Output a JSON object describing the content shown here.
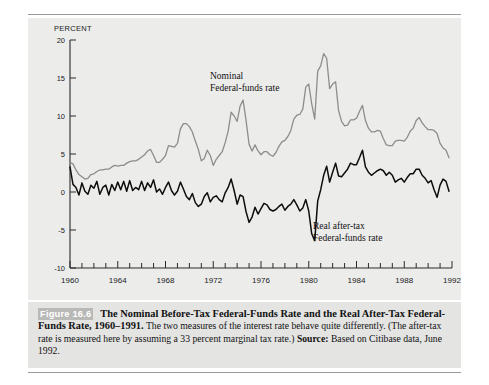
{
  "figure": {
    "number_label": "Figure 16.6",
    "title": "The  Nominal Before-Tax Federal-Funds Rate and the Real After-Tax Federal-Funds Rate, 1960–1991.",
    "body_text_1": " The two measures of the interest rate behave quite differently. (The after-tax rate is measured here by assuming a 33 percent marginal tax rate.) ",
    "source_label": "Source:",
    "source_text": " Based on Citibase data, June 1992."
  },
  "colors": {
    "panel_background": "#ececeb",
    "caption_background": "#e4e4e3",
    "nominal_series": "#8d8d8d",
    "real_series": "#0d0d0d",
    "axis": "#2a2a2a",
    "badge_background": "#b9b9b8"
  },
  "annotations": {
    "nominal": [
      "Nominal",
      "Federal-funds rate"
    ],
    "real": [
      "Real after-tax",
      "Federal-funds rate"
    ]
  },
  "chart_data": {
    "type": "line",
    "xlabel": "",
    "ylabel": "PERCENT",
    "ylim": [
      -10,
      20
    ],
    "xlim": [
      1960,
      1992
    ],
    "ytick_values": [
      -10,
      -5,
      0,
      5,
      10,
      15,
      20
    ],
    "ytick_labels": [
      "-10",
      "-5",
      "0",
      "5",
      "10",
      "15",
      "20"
    ],
    "xtick_labels": [
      "1960",
      "1964",
      "1968",
      "1972",
      "1976",
      "1980",
      "1984",
      "1988",
      "1992"
    ],
    "xtick_values": [
      1960,
      1964,
      1968,
      1972,
      1976,
      1980,
      1984,
      1988,
      1992
    ],
    "xminor_step": 1,
    "grid": false,
    "legend": "annotated-inline",
    "series": [
      {
        "name": "Nominal Federal-funds rate",
        "color": "#8d8d8d",
        "x": [
          1960.0,
          1960.25,
          1960.5,
          1960.75,
          1961.0,
          1961.25,
          1961.5,
          1961.75,
          1962.0,
          1962.25,
          1962.5,
          1962.75,
          1963.0,
          1963.25,
          1963.5,
          1963.75,
          1964.0,
          1964.25,
          1964.5,
          1964.75,
          1965.0,
          1965.25,
          1965.5,
          1965.75,
          1966.0,
          1966.25,
          1966.5,
          1966.75,
          1967.0,
          1967.25,
          1967.5,
          1967.75,
          1968.0,
          1968.25,
          1968.5,
          1968.75,
          1969.0,
          1969.25,
          1969.5,
          1969.75,
          1970.0,
          1970.25,
          1970.5,
          1970.75,
          1971.0,
          1971.25,
          1971.5,
          1971.75,
          1972.0,
          1972.25,
          1972.5,
          1972.75,
          1973.0,
          1973.25,
          1973.5,
          1973.75,
          1974.0,
          1974.25,
          1974.5,
          1974.75,
          1975.0,
          1975.25,
          1975.5,
          1975.75,
          1976.0,
          1976.25,
          1976.5,
          1976.75,
          1977.0,
          1977.25,
          1977.5,
          1977.75,
          1978.0,
          1978.25,
          1978.5,
          1978.75,
          1979.0,
          1979.25,
          1979.5,
          1979.75,
          1980.0,
          1980.25,
          1980.5,
          1980.75,
          1981.0,
          1981.25,
          1981.5,
          1981.75,
          1982.0,
          1982.25,
          1982.5,
          1982.75,
          1983.0,
          1983.25,
          1983.5,
          1983.75,
          1984.0,
          1984.25,
          1984.5,
          1984.75,
          1985.0,
          1985.25,
          1985.5,
          1985.75,
          1986.0,
          1986.25,
          1986.5,
          1986.75,
          1987.0,
          1987.25,
          1987.5,
          1987.75,
          1988.0,
          1988.25,
          1988.5,
          1988.75,
          1989.0,
          1989.25,
          1989.5,
          1989.75,
          1990.0,
          1990.25,
          1990.5,
          1990.75,
          1991.0,
          1991.25,
          1991.5,
          1991.75
        ],
        "y": [
          3.9,
          3.7,
          2.9,
          2.3,
          2.0,
          1.7,
          1.8,
          2.3,
          2.4,
          2.7,
          2.9,
          2.9,
          3.0,
          3.0,
          3.3,
          3.5,
          3.4,
          3.5,
          3.5,
          3.8,
          4.0,
          4.1,
          4.1,
          4.3,
          4.6,
          4.9,
          5.4,
          5.6,
          4.8,
          3.9,
          3.9,
          4.3,
          4.8,
          6.1,
          6.0,
          5.9,
          6.4,
          8.3,
          9.0,
          9.0,
          8.6,
          7.9,
          6.7,
          5.6,
          4.1,
          4.4,
          5.5,
          4.8,
          3.5,
          4.3,
          4.8,
          5.3,
          6.5,
          8.0,
          10.5,
          10.0,
          9.3,
          11.3,
          12.1,
          9.4,
          6.3,
          5.4,
          6.2,
          5.4,
          4.9,
          5.3,
          5.3,
          4.9,
          4.7,
          5.2,
          6.0,
          6.6,
          6.8,
          7.3,
          8.1,
          9.6,
          10.1,
          10.2,
          10.9,
          13.8,
          14.2,
          11.6,
          9.6,
          15.9,
          16.6,
          18.2,
          17.6,
          13.6,
          14.2,
          14.5,
          10.7,
          9.3,
          8.7,
          8.8,
          9.5,
          9.5,
          9.7,
          10.6,
          11.4,
          9.4,
          8.4,
          7.9,
          7.9,
          8.1,
          8.0,
          7.0,
          6.2,
          6.1,
          6.1,
          6.7,
          6.8,
          6.8,
          6.7,
          7.2,
          8.0,
          8.4,
          9.4,
          9.8,
          9.1,
          8.6,
          8.2,
          8.2,
          8.1,
          7.7,
          6.4,
          5.8,
          5.5,
          4.5
        ]
      },
      {
        "name": "Real after-tax Federal-funds rate",
        "color": "#0d0d0d",
        "x": [
          1960.0,
          1960.25,
          1960.5,
          1960.75,
          1961.0,
          1961.25,
          1961.5,
          1961.75,
          1962.0,
          1962.25,
          1962.5,
          1962.75,
          1963.0,
          1963.25,
          1963.5,
          1963.75,
          1964.0,
          1964.25,
          1964.5,
          1964.75,
          1965.0,
          1965.25,
          1965.5,
          1965.75,
          1966.0,
          1966.25,
          1966.5,
          1966.75,
          1967.0,
          1967.25,
          1967.5,
          1967.75,
          1968.0,
          1968.25,
          1968.5,
          1968.75,
          1969.0,
          1969.25,
          1969.5,
          1969.75,
          1970.0,
          1970.25,
          1970.5,
          1970.75,
          1971.0,
          1971.25,
          1971.5,
          1971.75,
          1972.0,
          1972.25,
          1972.5,
          1972.75,
          1973.0,
          1973.25,
          1973.5,
          1973.75,
          1974.0,
          1974.25,
          1974.5,
          1974.75,
          1975.0,
          1975.25,
          1975.5,
          1975.75,
          1976.0,
          1976.25,
          1976.5,
          1976.75,
          1977.0,
          1977.25,
          1977.5,
          1977.75,
          1978.0,
          1978.25,
          1978.5,
          1978.75,
          1979.0,
          1979.25,
          1979.5,
          1979.75,
          1980.0,
          1980.25,
          1980.5,
          1980.75,
          1981.0,
          1981.25,
          1981.5,
          1981.75,
          1982.0,
          1982.25,
          1982.5,
          1982.75,
          1983.0,
          1983.25,
          1983.5,
          1983.75,
          1984.0,
          1984.25,
          1984.5,
          1984.75,
          1985.0,
          1985.25,
          1985.5,
          1985.75,
          1986.0,
          1986.25,
          1986.5,
          1986.75,
          1987.0,
          1987.25,
          1987.5,
          1987.75,
          1988.0,
          1988.25,
          1988.5,
          1988.75,
          1989.0,
          1989.25,
          1989.5,
          1989.75,
          1990.0,
          1990.25,
          1990.5,
          1990.75,
          1991.0,
          1991.25,
          1991.5,
          1991.75
        ],
        "y": [
          3.3,
          1.0,
          0.6,
          -0.4,
          1.2,
          0.1,
          -0.3,
          0.9,
          0.5,
          1.4,
          -0.3,
          0.6,
          0.9,
          -0.4,
          1.0,
          0.2,
          1.3,
          0.3,
          1.4,
          0.1,
          1.5,
          0.2,
          0.6,
          0.3,
          1.4,
          0.2,
          1.2,
          0.6,
          1.6,
          0.0,
          0.4,
          -0.3,
          0.6,
          1.3,
          0.2,
          -0.4,
          0.1,
          1.3,
          0.4,
          -0.6,
          -1.0,
          -0.2,
          -1.4,
          -1.9,
          -1.6,
          -0.6,
          -0.1,
          -1.3,
          -0.7,
          -0.5,
          -1.0,
          -1.3,
          -0.1,
          0.6,
          1.7,
          0.2,
          -1.6,
          -0.4,
          -0.6,
          -2.6,
          -4.0,
          -3.3,
          -2.0,
          -2.9,
          -2.2,
          -1.5,
          -1.7,
          -2.3,
          -2.5,
          -2.3,
          -1.9,
          -1.6,
          -2.4,
          -1.9,
          -1.6,
          -1.0,
          -1.7,
          -2.5,
          -2.1,
          -1.0,
          -2.5,
          -5.5,
          -6.4,
          -1.2,
          0.3,
          2.2,
          3.4,
          1.3,
          2.6,
          3.8,
          2.1,
          2.0,
          2.5,
          3.0,
          3.8,
          3.6,
          3.6,
          4.5,
          5.5,
          3.3,
          2.6,
          2.2,
          2.5,
          2.8,
          3.0,
          2.8,
          2.2,
          2.6,
          2.2,
          1.3,
          1.6,
          1.8,
          1.3,
          1.9,
          2.4,
          2.4,
          3.0,
          3.0,
          2.2,
          1.8,
          1.2,
          1.5,
          0.3,
          -0.7,
          0.9,
          1.7,
          1.4,
          0.1
        ]
      }
    ]
  }
}
